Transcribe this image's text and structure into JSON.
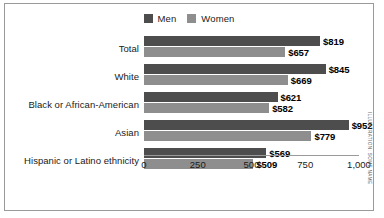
{
  "legend": {
    "entries": [
      {
        "label": "Men",
        "color": "#4d4d4d"
      },
      {
        "label": "Women",
        "color": "#8e8e8e"
      }
    ]
  },
  "credit": "ILLUSTRATION: SOME NAME",
  "axis": {
    "ticks": [
      "0",
      "250",
      "500",
      "750",
      "1,000"
    ]
  },
  "chart_data": {
    "type": "bar",
    "orientation": "horizontal",
    "title": "",
    "xlabel": "",
    "ylabel": "",
    "xlim": [
      0,
      1000
    ],
    "grid": false,
    "legend_position": "top-center",
    "categories": [
      "Total",
      "White",
      "Black or African-American",
      "Asian",
      "Hispanic or Latino ethnicity"
    ],
    "tick_values": [
      0,
      250,
      500,
      750,
      1000
    ],
    "tick_labels": [
      "0",
      "250",
      "500",
      "750",
      "1,000"
    ],
    "series": [
      {
        "name": "Men",
        "color": "#4d4d4d",
        "values": [
          819,
          845,
          621,
          952,
          569
        ],
        "labels": [
          "$819",
          "$845",
          "$621",
          "$952",
          "$569"
        ]
      },
      {
        "name": "Women",
        "color": "#8e8e8e",
        "values": [
          657,
          669,
          582,
          779,
          509
        ],
        "labels": [
          "$657",
          "$669",
          "$582",
          "$779",
          "$509"
        ]
      }
    ]
  }
}
